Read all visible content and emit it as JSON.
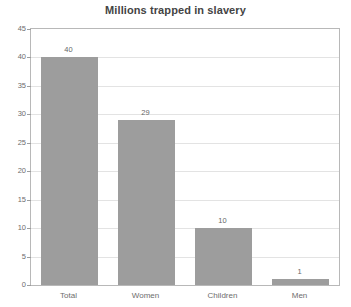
{
  "chart_data": {
    "type": "bar",
    "title": "Millions trapped in slavery",
    "xlabel": "",
    "ylabel": "",
    "categories": [
      "Total",
      "Women",
      "Children",
      "Men"
    ],
    "values": [
      40,
      29,
      10,
      1
    ],
    "value_labels": [
      "40",
      "29",
      "10",
      "1"
    ],
    "ylim": [
      0,
      45
    ],
    "yticks": [
      0,
      5,
      10,
      15,
      20,
      25,
      30,
      35,
      40,
      45
    ],
    "ytick_labels": [
      "0",
      "5",
      "10",
      "15",
      "20",
      "25",
      "30",
      "35",
      "40",
      "45"
    ],
    "grid": true,
    "grid_axis": "y",
    "legend": false,
    "legend_position": "none",
    "bar_color": "#9d9d9d",
    "grid_color": "#e3e3e3",
    "axis_color": "#b8b8b8",
    "title_color": "#444444",
    "tick_label_color": "#6d6d6d",
    "background_color": "#ffffff"
  }
}
